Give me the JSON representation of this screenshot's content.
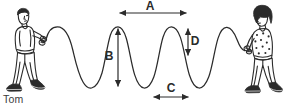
{
  "figure": {
    "background_color": "#ffffff",
    "ink_color": "#2b2b2b",
    "width": 284,
    "height": 110
  },
  "people": [
    {
      "id": "tom",
      "name_label": "Tom",
      "position": "left",
      "facing": "right",
      "description": "boy with short hair walking right, holding rope end",
      "hair": "short",
      "shirt": "plain"
    },
    {
      "id": "girl",
      "name_label": "",
      "position": "right",
      "facing": "left",
      "description": "girl with curly bob hair walking left, holding rope end",
      "hair": "curly-bob",
      "shirt": "polka-dot"
    }
  ],
  "wave": {
    "crests": 3,
    "troughs": 3,
    "baseline_y": 57,
    "amplitude_px": 30,
    "wavelength_px": 70,
    "left_end_x": 47,
    "right_end_x": 245
  },
  "dimension_labels": [
    {
      "id": "A",
      "letter": "A",
      "meaning": "wavelength (crest to crest)",
      "orientation": "horizontal",
      "arrow": "double",
      "from": [
        118,
        13
      ],
      "to": [
        188,
        13
      ],
      "letter_pos": [
        150,
        9
      ]
    },
    {
      "id": "B",
      "letter": "B",
      "meaning": "peak-to-trough height",
      "orientation": "vertical",
      "arrow": "double",
      "from": [
        118,
        27
      ],
      "to": [
        118,
        88
      ],
      "letter_pos": [
        110,
        60
      ]
    },
    {
      "id": "C",
      "letter": "C",
      "meaning": "half wavelength at trough",
      "orientation": "horizontal",
      "arrow": "double",
      "from": [
        152,
        97
      ],
      "to": [
        190,
        97
      ],
      "letter_pos": [
        171,
        91
      ]
    },
    {
      "id": "D",
      "letter": "D",
      "meaning": "amplitude (crest to midline)",
      "orientation": "vertical",
      "arrow": "double",
      "from": [
        188,
        27
      ],
      "to": [
        188,
        57
      ],
      "letter_pos": [
        194,
        45
      ]
    }
  ]
}
